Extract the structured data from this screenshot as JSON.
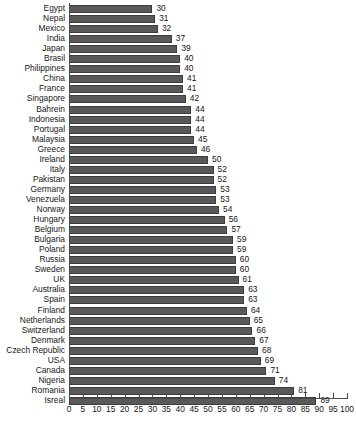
{
  "chart_data": {
    "type": "bar",
    "orientation": "horizontal",
    "title": "",
    "subtitle": "",
    "xlabel": "",
    "ylabel": "",
    "xlim": [
      0,
      100
    ],
    "xticks": [
      0,
      5,
      10,
      15,
      20,
      25,
      30,
      35,
      40,
      45,
      50,
      55,
      60,
      65,
      70,
      75,
      80,
      85,
      90,
      95,
      100
    ],
    "grid": false,
    "legend": null,
    "data_labels": true,
    "bar_color": "#595959",
    "bar_edge_color": "#3d3d3d",
    "background_color": "#ffffff",
    "axis_color": "#4a4a4a",
    "categories": [
      "Egypt",
      "Nepal",
      "Mexico",
      "India",
      "Japan",
      "Brasil",
      "Philippines",
      "China",
      "France",
      "Singapore",
      "Bahrein",
      "Indonesia",
      "Portugal",
      "Malaysia",
      "Greece",
      "Ireland",
      "Italy",
      "Pakistan",
      "Germany",
      "Venezuela",
      "Norway",
      "Hungary",
      "Belgium",
      "Bulgaria",
      "Poland",
      "Russia",
      "Sweden",
      "UK",
      "Australia",
      "Spain",
      "Finland",
      "Netherlands",
      "Switzerland",
      "Denmark",
      "Czech Republic",
      "USA",
      "Canada",
      "Nigeria",
      "Romania",
      "Isreal"
    ],
    "values": [
      30,
      31,
      32,
      37,
      39,
      40,
      40,
      41,
      41,
      42,
      44,
      44,
      44,
      45,
      46,
      50,
      52,
      52,
      53,
      53,
      54,
      56,
      57,
      59,
      59,
      60,
      60,
      61,
      63,
      63,
      64,
      65,
      66,
      67,
      68,
      69,
      71,
      74,
      81,
      89
    ]
  }
}
